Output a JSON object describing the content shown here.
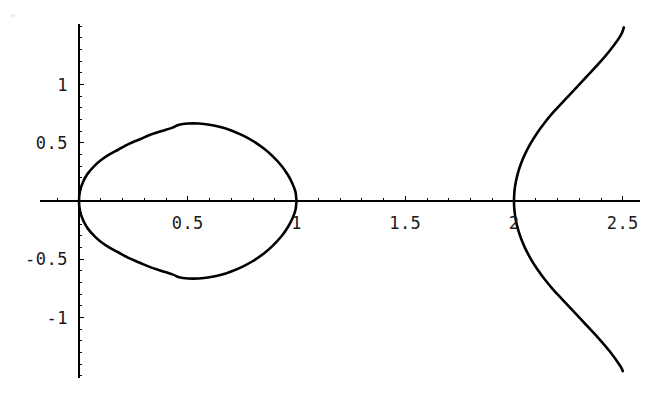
{
  "figure": {
    "background_color": "#ffffff",
    "curve_color": "#000000",
    "axis_color": "#000000",
    "label_color": "#1a1a1a"
  },
  "chart_data": {
    "type": "line",
    "title": "",
    "subtitle": "",
    "xlabel": "",
    "ylabel": "",
    "grid": false,
    "legend": false,
    "axes_style": "centered-cross-with-ticks",
    "xlim": [
      -0.18,
      2.58
    ],
    "ylim": [
      -1.52,
      1.52
    ],
    "x_tick_labels": [
      "0.5",
      "1",
      "1.5",
      "2",
      "2.5"
    ],
    "x_tick_values": [
      0.5,
      1,
      1.5,
      2,
      2.5
    ],
    "y_tick_labels": [
      "1",
      "0.5",
      "-0.5",
      "-1"
    ],
    "y_tick_values": [
      1,
      0.5,
      -0.5,
      -1
    ],
    "x_minor_tick_step": 0.1,
    "y_minor_tick_step": 0.1,
    "annotations": [],
    "series": [
      {
        "name": "loop-branch",
        "description": "closed oval loop from origin (0,0) to (1,0)",
        "x_range": [
          0,
          1
        ],
        "y_range": [
          -0.67,
          0.67
        ],
        "points_upper": [
          [
            0.0,
            0.0
          ],
          [
            0.005,
            0.09
          ],
          [
            0.02,
            0.17
          ],
          [
            0.04,
            0.235
          ],
          [
            0.07,
            0.3
          ],
          [
            0.1,
            0.35
          ],
          [
            0.14,
            0.4
          ],
          [
            0.18,
            0.44
          ],
          [
            0.23,
            0.49
          ],
          [
            0.28,
            0.53
          ],
          [
            0.33,
            0.57
          ],
          [
            0.38,
            0.6
          ],
          [
            0.43,
            0.63
          ],
          [
            0.46,
            0.655
          ],
          [
            0.5,
            0.665
          ],
          [
            0.55,
            0.665
          ],
          [
            0.6,
            0.655
          ],
          [
            0.65,
            0.635
          ],
          [
            0.7,
            0.605
          ],
          [
            0.75,
            0.565
          ],
          [
            0.8,
            0.515
          ],
          [
            0.85,
            0.45
          ],
          [
            0.89,
            0.385
          ],
          [
            0.93,
            0.305
          ],
          [
            0.96,
            0.225
          ],
          [
            0.98,
            0.155
          ],
          [
            0.995,
            0.08
          ],
          [
            1.0,
            0.0
          ]
        ],
        "points_lower": [
          [
            0.0,
            0.0
          ],
          [
            0.005,
            -0.09
          ],
          [
            0.02,
            -0.17
          ],
          [
            0.04,
            -0.235
          ],
          [
            0.07,
            -0.3
          ],
          [
            0.1,
            -0.35
          ],
          [
            0.14,
            -0.4
          ],
          [
            0.18,
            -0.44
          ],
          [
            0.23,
            -0.49
          ],
          [
            0.28,
            -0.53
          ],
          [
            0.33,
            -0.57
          ],
          [
            0.38,
            -0.6
          ],
          [
            0.43,
            -0.63
          ],
          [
            0.46,
            -0.655
          ],
          [
            0.5,
            -0.665
          ],
          [
            0.55,
            -0.665
          ],
          [
            0.6,
            -0.655
          ],
          [
            0.65,
            -0.635
          ],
          [
            0.7,
            -0.605
          ],
          [
            0.75,
            -0.565
          ],
          [
            0.8,
            -0.515
          ],
          [
            0.85,
            -0.45
          ],
          [
            0.89,
            -0.385
          ],
          [
            0.93,
            -0.305
          ],
          [
            0.96,
            -0.225
          ],
          [
            0.98,
            -0.155
          ],
          [
            0.995,
            -0.08
          ],
          [
            1.0,
            0.0
          ]
        ]
      },
      {
        "name": "open-branch",
        "description": "open branch with vertex at (2,0) opening to the right",
        "x_range": [
          2.0,
          2.5
        ],
        "y_range": [
          -1.46,
          1.5
        ],
        "points_upper": [
          [
            2.0,
            0.0
          ],
          [
            2.002,
            0.08
          ],
          [
            2.008,
            0.16
          ],
          [
            2.018,
            0.24
          ],
          [
            2.032,
            0.32
          ],
          [
            2.05,
            0.4
          ],
          [
            2.075,
            0.49
          ],
          [
            2.105,
            0.58
          ],
          [
            2.14,
            0.67
          ],
          [
            2.18,
            0.76
          ],
          [
            2.225,
            0.85
          ],
          [
            2.275,
            0.95
          ],
          [
            2.33,
            1.06
          ],
          [
            2.385,
            1.17
          ],
          [
            2.44,
            1.29
          ],
          [
            2.49,
            1.42
          ],
          [
            2.505,
            1.49
          ]
        ],
        "points_lower": [
          [
            2.0,
            0.0
          ],
          [
            2.002,
            -0.08
          ],
          [
            2.008,
            -0.16
          ],
          [
            2.018,
            -0.24
          ],
          [
            2.032,
            -0.32
          ],
          [
            2.05,
            -0.4
          ],
          [
            2.075,
            -0.49
          ],
          [
            2.105,
            -0.58
          ],
          [
            2.14,
            -0.67
          ],
          [
            2.18,
            -0.76
          ],
          [
            2.225,
            -0.85
          ],
          [
            2.275,
            -0.95
          ],
          [
            2.33,
            -1.06
          ],
          [
            2.385,
            -1.17
          ],
          [
            2.44,
            -1.29
          ],
          [
            2.49,
            -1.42
          ],
          [
            2.5,
            -1.46
          ]
        ]
      }
    ]
  },
  "axis_labels": {
    "x": [
      {
        "text": "0.5",
        "value": 0.5
      },
      {
        "text": "1",
        "value": 1
      },
      {
        "text": "1.5",
        "value": 1.5
      },
      {
        "text": "2",
        "value": 2
      },
      {
        "text": "2.5",
        "value": 2.5
      }
    ],
    "y": [
      {
        "text": "1",
        "value": 1
      },
      {
        "text": "0.5",
        "value": 0.5
      },
      {
        "text": "-0.5",
        "value": -0.5
      },
      {
        "text": "-1",
        "value": -1
      }
    ]
  }
}
